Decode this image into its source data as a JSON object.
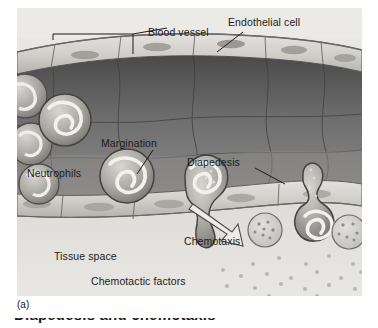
{
  "figure": {
    "panel_label": "(a)",
    "caption_partial": "Diapedesis and chemotaxis",
    "background_color": "#e9e9e7",
    "ink_color": "#1b1b1b"
  },
  "labels": {
    "blood_vessel": "Blood vessel",
    "endothelial_cell": "Endothelial cell",
    "margination": "Margination",
    "diapedesis": "Diapedesis",
    "neutrophils": "Neutrophils",
    "chemotaxis": "Chemotaxis",
    "tissue_space": "Tissue space",
    "chemotactic_factors": "Chemotactic factors"
  },
  "diagram": {
    "type": "biological-illustration",
    "structures": [
      "endothelial cell layer (upper wall)",
      "endothelial cell layer (lower wall)",
      "vessel lumen",
      "neutrophils in circulation",
      "neutrophil marginating against wall",
      "neutrophil undergoing diapedesis",
      "tissue space",
      "chemotactic factor gradient"
    ],
    "leader_lines": [
      {
        "label": "Blood vessel",
        "style": "bracket"
      },
      {
        "label": "Endothelial cell",
        "style": "line"
      },
      {
        "label": "Margination",
        "style": "line"
      },
      {
        "label": "Diapedesis",
        "style": "line"
      },
      {
        "label": "Chemotaxis",
        "style": "open-arrow"
      }
    ]
  }
}
